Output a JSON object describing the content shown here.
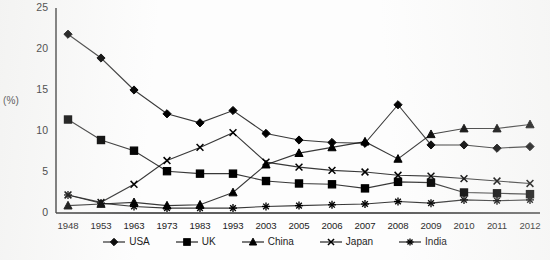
{
  "chart_data": {
    "type": "line",
    "title": "",
    "subtitle": "",
    "xlabel": "",
    "ylabel": "(%)",
    "ylim": [
      0,
      25
    ],
    "yticks": [
      0,
      5,
      10,
      15,
      20,
      25
    ],
    "grid": false,
    "legend_position": "bottom",
    "categories": [
      "1948",
      "1953",
      "1963",
      "1973",
      "1983",
      "1993",
      "2003",
      "2005",
      "2006",
      "2007",
      "2008",
      "2009",
      "2010",
      "2011",
      "2012"
    ],
    "series": [
      {
        "name": "USA",
        "marker": "diamond",
        "color": "#000000",
        "values": [
          21.8,
          18.9,
          15.0,
          12.1,
          11.0,
          12.5,
          9.7,
          8.9,
          8.6,
          8.5,
          13.2,
          8.3,
          8.3,
          7.9,
          8.1
        ]
      },
      {
        "name": "UK",
        "marker": "square",
        "color": "#000000",
        "values": [
          11.4,
          8.9,
          7.6,
          5.1,
          4.8,
          4.8,
          3.9,
          3.6,
          3.5,
          3.0,
          3.8,
          3.7,
          2.5,
          2.4,
          2.3
        ]
      },
      {
        "name": "China",
        "marker": "triangle",
        "color": "#000000",
        "values": [
          0.9,
          1.1,
          1.3,
          0.9,
          1.0,
          2.5,
          5.9,
          7.3,
          8.0,
          8.7,
          6.6,
          9.6,
          10.3,
          10.3,
          10.8
        ]
      },
      {
        "name": "Japan",
        "marker": "cross",
        "color": "#000000",
        "values": [
          2.2,
          1.3,
          3.5,
          6.4,
          8.0,
          9.8,
          6.2,
          5.6,
          5.2,
          5.0,
          4.6,
          4.5,
          4.2,
          3.9,
          3.6
        ]
      },
      {
        "name": "India",
        "marker": "asterisk",
        "color": "#000000",
        "values": [
          2.2,
          1.2,
          0.8,
          0.6,
          0.6,
          0.6,
          0.8,
          0.9,
          1.0,
          1.1,
          1.4,
          1.2,
          1.6,
          1.5,
          1.6
        ]
      }
    ]
  },
  "axis": {
    "y_label": "(%)"
  },
  "legend": {
    "items": [
      {
        "label": "USA",
        "marker": "diamond-marker-icon"
      },
      {
        "label": "UK",
        "marker": "square-marker-icon"
      },
      {
        "label": "China",
        "marker": "triangle-marker-icon"
      },
      {
        "label": "Japan",
        "marker": "cross-marker-icon"
      },
      {
        "label": "India",
        "marker": "asterisk-marker-icon"
      }
    ]
  }
}
